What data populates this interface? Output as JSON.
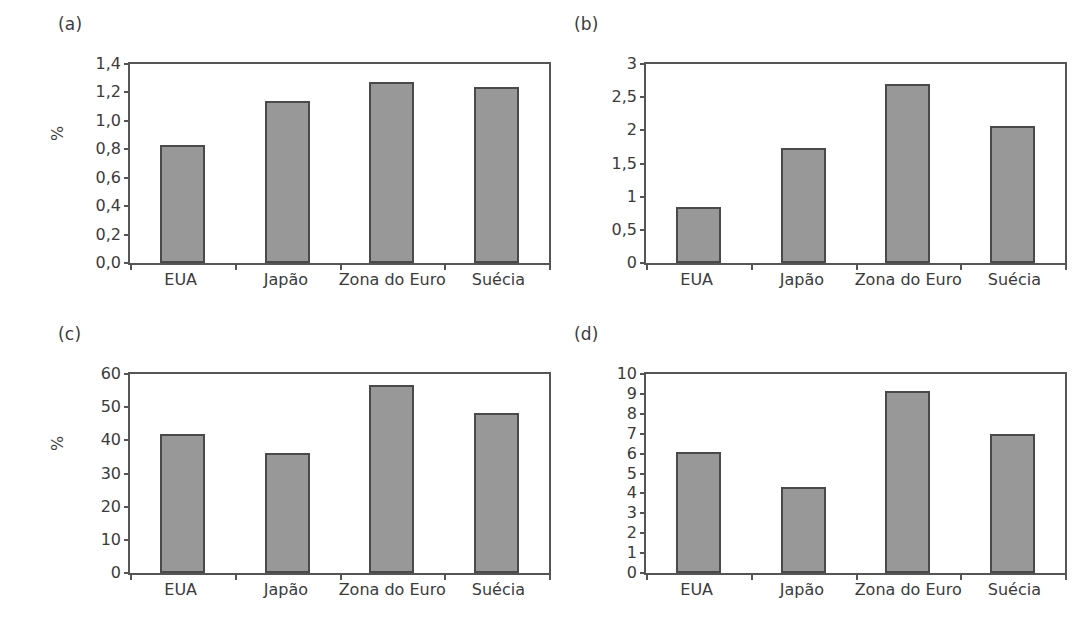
{
  "figure": {
    "background": "#ffffff",
    "bar_fill": "#989898",
    "bar_edge": "#4a4a4a",
    "axis_color": "#555555",
    "text_color": "#3b3b3b"
  },
  "panels": [
    {
      "tag": "(a)",
      "ylabel": "%",
      "chart_data": {
        "type": "bar",
        "title": "(a)",
        "xlabel": "",
        "ylabel": "%",
        "categories": [
          "EUA",
          "Japão",
          "Zona do Euro",
          "Suécia"
        ],
        "values": [
          0.83,
          1.14,
          1.27,
          1.24
        ],
        "ylim": [
          0.0,
          1.4
        ],
        "yticks": [
          0.0,
          0.2,
          0.4,
          0.6,
          0.8,
          1.0,
          1.2,
          1.4
        ],
        "ytick_labels": [
          "0,0",
          "0,2",
          "0,4",
          "0,6",
          "0,8",
          "1,0",
          "1,2",
          "1,4"
        ],
        "grid": false,
        "legend": false
      }
    },
    {
      "tag": "(b)",
      "ylabel": "",
      "chart_data": {
        "type": "bar",
        "title": "(b)",
        "xlabel": "",
        "ylabel": "",
        "categories": [
          "EUA",
          "Japão",
          "Zona do Euro",
          "Suécia"
        ],
        "values": [
          0.85,
          1.73,
          2.7,
          2.06
        ],
        "ylim": [
          0,
          3
        ],
        "yticks": [
          0,
          0.5,
          1,
          1.5,
          2,
          2.5,
          3
        ],
        "ytick_labels": [
          "0",
          "0,5",
          "1",
          "1,5",
          "2",
          "2,5",
          "3"
        ],
        "grid": false,
        "legend": false
      }
    },
    {
      "tag": "(c)",
      "ylabel": "%",
      "chart_data": {
        "type": "bar",
        "title": "(c)",
        "xlabel": "",
        "ylabel": "%",
        "categories": [
          "EUA",
          "Japão",
          "Zona do Euro",
          "Suécia"
        ],
        "values": [
          42.0,
          36.3,
          56.7,
          48.3
        ],
        "ylim": [
          0,
          60
        ],
        "yticks": [
          0,
          10,
          20,
          30,
          40,
          50,
          60
        ],
        "ytick_labels": [
          "0",
          "10",
          "20",
          "30",
          "40",
          "50",
          "60"
        ],
        "grid": false,
        "legend": false
      }
    },
    {
      "tag": "(d)",
      "ylabel": "",
      "chart_data": {
        "type": "bar",
        "title": "(d)",
        "xlabel": "",
        "ylabel": "",
        "categories": [
          "EUA",
          "Japão",
          "Zona do Euro",
          "Suécia"
        ],
        "values": [
          6.1,
          4.3,
          9.15,
          7.0
        ],
        "ylim": [
          0,
          10
        ],
        "yticks": [
          0,
          1,
          2,
          3,
          4,
          5,
          6,
          7,
          8,
          9,
          10
        ],
        "ytick_labels": [
          "0",
          "1",
          "2",
          "3",
          "4",
          "5",
          "6",
          "7",
          "8",
          "9",
          "10"
        ],
        "grid": false,
        "legend": false
      }
    }
  ]
}
